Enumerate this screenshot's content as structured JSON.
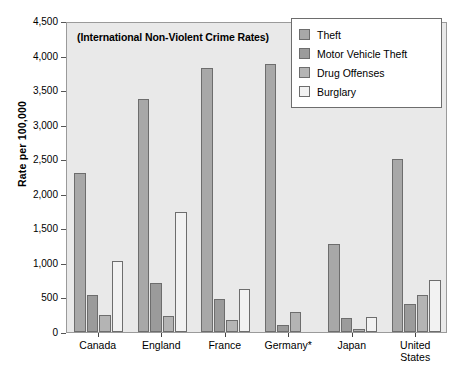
{
  "chart_data": {
    "type": "bar",
    "title": "(International Non-Violent Crime Rates)",
    "xlabel": "",
    "ylabel": "Rate per 100,000",
    "categories": [
      "Canada",
      "England",
      "France",
      "Germany*",
      "Japan",
      "United\nStates"
    ],
    "series": [
      {
        "name": "Theft",
        "color": "#a8a8a8",
        "values": [
          2300,
          3370,
          3820,
          3880,
          1280,
          2500
        ]
      },
      {
        "name": "Motor Vehicle Theft",
        "color": "#9b9b9b",
        "values": [
          540,
          710,
          480,
          100,
          200,
          400
        ]
      },
      {
        "name": "Drug Offenses",
        "color": "#b4b4b4",
        "values": [
          250,
          230,
          170,
          290,
          50,
          530
        ]
      },
      {
        "name": "Burglary",
        "color": "#f2f2f2",
        "values": [
          1030,
          1730,
          620,
          0,
          220,
          750
        ]
      }
    ],
    "ylim": [
      0,
      4500
    ],
    "yticks": [
      0,
      500,
      1000,
      1500,
      2000,
      2500,
      3000,
      3500,
      4000,
      4500
    ],
    "ytick_labels": [
      "0",
      "500",
      "1,000",
      "1,500",
      "2,000",
      "2,500",
      "3,000",
      "3,500",
      "4,000",
      "4,500"
    ],
    "grid": false,
    "legend_position": "top-right",
    "plot_background": "#e9e9e9",
    "frame_color": "#9a9a9a"
  }
}
